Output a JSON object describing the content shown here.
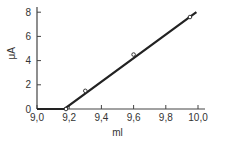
{
  "chart_data": {
    "type": "line",
    "title": "",
    "xlabel": "ml",
    "ylabel": "μA",
    "xlim": [
      9.0,
      10.1
    ],
    "ylim": [
      0,
      8.4
    ],
    "grid": false,
    "x_ticks": [
      9.0,
      9.2,
      9.4,
      9.6,
      9.8,
      10.0
    ],
    "x_tick_labels": [
      "9,0",
      "9,2",
      "9,4",
      "9,6",
      "9,8",
      "10,0"
    ],
    "y_ticks": [
      0,
      2,
      4,
      6,
      8
    ],
    "y_tick_labels": [
      "0",
      "2",
      "4",
      "6",
      "8"
    ],
    "series": [
      {
        "name": "titration curve",
        "line": {
          "x": [
            9.0,
            9.17,
            9.99
          ],
          "y": [
            0,
            0,
            8.0
          ]
        },
        "markers": {
          "x": [
            9.18,
            9.3,
            9.6,
            9.95
          ],
          "y": [
            0,
            1.5,
            4.5,
            7.6
          ]
        }
      }
    ]
  }
}
